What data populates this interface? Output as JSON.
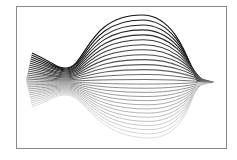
{
  "figure": {
    "frame": {
      "x": 16,
      "y": 6,
      "width": 210,
      "height": 142,
      "stroke": "#8a8a8a"
    },
    "line_count": 28,
    "color_top": "#111111",
    "color_bottom": "#d8d8d8",
    "shape": {
      "tail_left_x": 26,
      "tail_top_y": 53,
      "tail_bottom_y": 107,
      "neck_x": 66,
      "neck_top_y": 68,
      "neck_bottom_y": 95,
      "dome_peak_x": 150,
      "dome_peak_y": 15,
      "right_tip_x": 214,
      "right_tip_y": 82,
      "bottom_y": 138,
      "kink_x": 166
    }
  }
}
